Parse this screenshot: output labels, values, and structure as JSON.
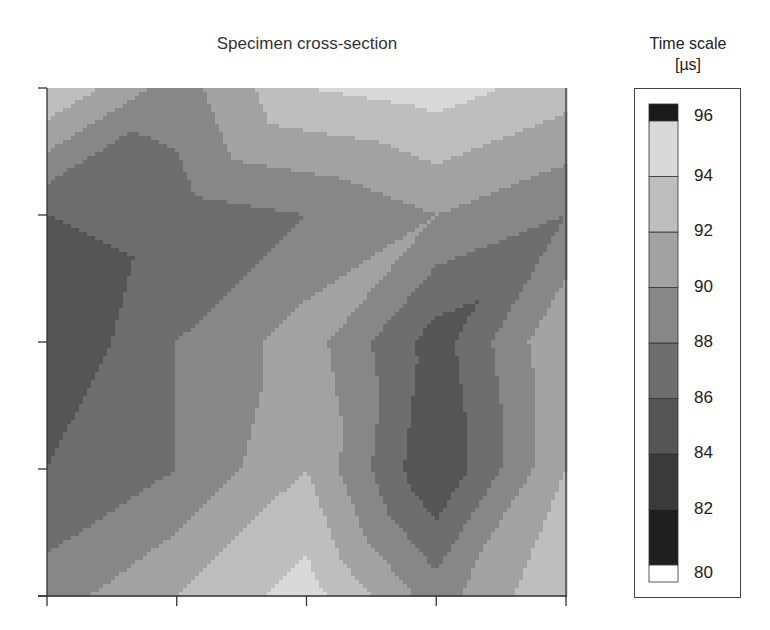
{
  "chart_data": {
    "type": "heatmap",
    "subtype": "filled-contour",
    "title": "Specimen cross-section",
    "xlabel": "",
    "ylabel": "",
    "x": [
      0,
      1,
      2,
      3,
      4
    ],
    "y": [
      0,
      1,
      2,
      3,
      4
    ],
    "x_tick_labels": [
      "",
      "",
      "",
      "",
      ""
    ],
    "y_tick_labels": [
      "",
      "",
      "",
      "",
      ""
    ],
    "z_rows_top_to_bottom": [
      [
        94,
        89,
        94,
        95,
        93
      ],
      [
        86,
        87,
        88,
        90,
        88
      ],
      [
        84,
        88,
        91,
        85,
        92
      ],
      [
        86,
        88,
        92,
        84,
        92
      ],
      [
        89,
        92,
        95,
        89,
        94
      ]
    ],
    "colorbar": {
      "title": "Time scale",
      "unit": "[µs]",
      "levels": [
        80,
        82,
        84,
        86,
        88,
        90,
        92,
        94,
        96
      ],
      "tick_labels": [
        "80",
        "82",
        "84",
        "86",
        "88",
        "90",
        "92",
        "94",
        "96"
      ],
      "band_colors": [
        "#1f1f1f",
        "#3a3a3a",
        "#555555",
        "#6e6e6e",
        "#878787",
        "#a2a2a2",
        "#bebebe",
        "#d9d9d9",
        "#f2f2f2"
      ],
      "under_color": "#ffffff",
      "over_color": "#1a1a1a",
      "note": "bands colored from dark (low) to light (high); bottom swatch under-range, top swatch over-range"
    },
    "grid": false,
    "legend_position": "right (colorbar)"
  }
}
